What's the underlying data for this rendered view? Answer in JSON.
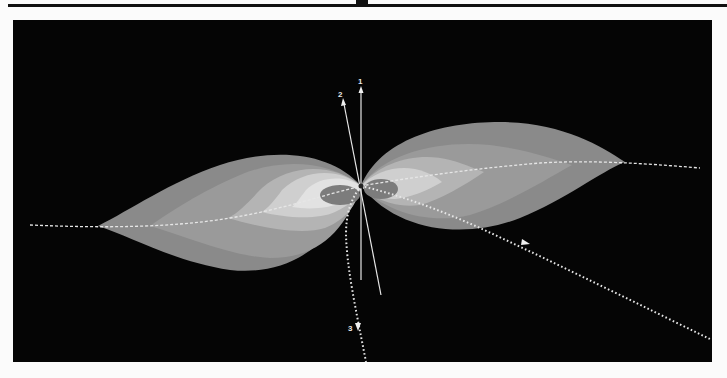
{
  "figure": {
    "axes": [
      {
        "id": "1",
        "label": "1",
        "style": "solid"
      },
      {
        "id": "2",
        "label": "2",
        "style": "solid"
      },
      {
        "id": "3",
        "label": "3",
        "style": "dotted"
      }
    ],
    "colors": {
      "background": "#050505",
      "page": "#fbfbfb",
      "lobe_outer": "#8a8a8a",
      "lobe_mid": "#9c9c9c",
      "lobe_light": "#bdbdbd",
      "lobe_lighter": "#d4d4d4",
      "lobe_core": "#e4e4e4",
      "center_disk": "#7a7a7a",
      "lines": "#e6e6e6"
    }
  }
}
